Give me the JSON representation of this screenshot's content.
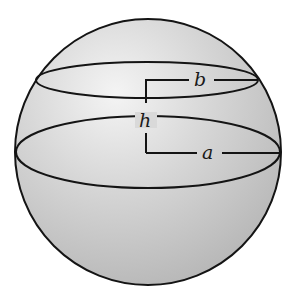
{
  "figure": {
    "labels": {
      "b": "b",
      "h": "h",
      "a": "a"
    },
    "colors": {
      "sphere_fill_light": "#f2f2f2",
      "sphere_fill_dark": "#b9b9b9",
      "stroke": "#141414",
      "background": "#ffffff"
    }
  }
}
